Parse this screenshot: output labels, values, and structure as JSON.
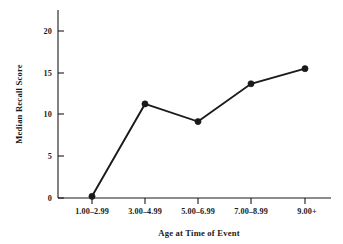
{
  "chart_data": {
    "type": "line",
    "title": "",
    "xlabel": "Age at Time of Event",
    "ylabel": "Median Recall Score",
    "categories": [
      "1.00–2.99",
      "3.00–4.99",
      "5.00–6.99",
      "7.00–8.99",
      "9.00+"
    ],
    "values": [
      0.2,
      11.2,
      9.1,
      13.6,
      15.4
    ],
    "series": [
      {
        "name": "Median Recall Score",
        "values": [
          0.2,
          11.2,
          9.1,
          13.6,
          15.4
        ]
      }
    ],
    "ylim": [
      0,
      22
    ],
    "yticks": [
      0,
      5,
      10,
      15,
      20
    ],
    "ytick_labels": [
      "0",
      "5",
      "10",
      "15",
      "20"
    ],
    "grid": false,
    "legend": "none",
    "marker": "filled-circle",
    "line_color": "#1a1a1a",
    "marker_color": "#1a1a1a",
    "background_color": "#ffffff"
  },
  "axes": {
    "y_tick_0": "0",
    "y_tick_1": "5",
    "y_tick_2": "10",
    "y_tick_3": "15",
    "y_tick_4": "20",
    "x_tick_0": "1.00–2.99",
    "x_tick_1": "3.00–4.99",
    "x_tick_2": "5.00–6.99",
    "x_tick_3": "7.00–8.99",
    "x_tick_4": "9.00+",
    "x_axis_title": "Age at Time of Event",
    "y_axis_title": "Median Recall Score"
  }
}
